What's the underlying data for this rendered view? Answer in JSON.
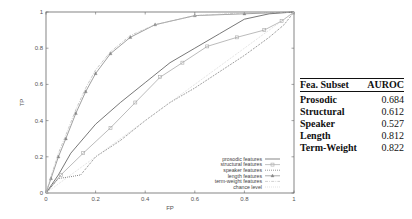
{
  "chart_data": {
    "type": "line",
    "title": "",
    "xlabel": "FP",
    "ylabel": "TP",
    "xlim": [
      0,
      1
    ],
    "ylim": [
      0,
      1
    ],
    "x_ticks": [
      "0",
      "0.2",
      "0.4",
      "0.6",
      "0.8",
      "1"
    ],
    "y_ticks": [
      "0",
      "0.2",
      "0.4",
      "0.6",
      "0.8",
      "1"
    ],
    "grid": false,
    "legend_position": "lower right",
    "series": [
      {
        "name": "prosodic features",
        "marker": "none",
        "style": "solid",
        "color": "#555555",
        "points": [
          [
            0,
            0
          ],
          [
            0.05,
            0.1
          ],
          [
            0.1,
            0.22
          ],
          [
            0.2,
            0.38
          ],
          [
            0.3,
            0.5
          ],
          [
            0.4,
            0.61
          ],
          [
            0.5,
            0.72
          ],
          [
            0.6,
            0.8
          ],
          [
            0.7,
            0.88
          ],
          [
            0.8,
            0.96
          ],
          [
            0.9,
            0.99
          ],
          [
            1,
            1
          ]
        ]
      },
      {
        "name": "structural features",
        "marker": "square",
        "style": "solid",
        "color": "#aaaaaa",
        "points": [
          [
            0,
            0
          ],
          [
            0.06,
            0.1
          ],
          [
            0.15,
            0.22
          ],
          [
            0.26,
            0.36
          ],
          [
            0.36,
            0.5
          ],
          [
            0.46,
            0.64
          ],
          [
            0.55,
            0.72
          ],
          [
            0.65,
            0.81
          ],
          [
            0.77,
            0.86
          ],
          [
            0.88,
            0.9
          ],
          [
            0.95,
            0.95
          ],
          [
            1,
            1
          ]
        ]
      },
      {
        "name": "speaker features",
        "marker": "none",
        "style": "dotted",
        "color": "#444444",
        "points": [
          [
            0,
            0
          ],
          [
            0.05,
            0.08
          ],
          [
            0.1,
            0.09
          ],
          [
            0.14,
            0.1
          ],
          [
            0.2,
            0.2
          ],
          [
            0.3,
            0.29
          ],
          [
            0.4,
            0.4
          ],
          [
            0.5,
            0.5
          ],
          [
            0.6,
            0.58
          ],
          [
            0.7,
            0.67
          ],
          [
            0.8,
            0.76
          ],
          [
            0.9,
            0.86
          ],
          [
            0.96,
            0.93
          ],
          [
            1,
            1
          ]
        ]
      },
      {
        "name": "length features",
        "marker": "triangle",
        "style": "solid",
        "color": "#888888",
        "points": [
          [
            0,
            0
          ],
          [
            0.02,
            0.08
          ],
          [
            0.05,
            0.2
          ],
          [
            0.08,
            0.3
          ],
          [
            0.12,
            0.44
          ],
          [
            0.16,
            0.56
          ],
          [
            0.2,
            0.66
          ],
          [
            0.26,
            0.77
          ],
          [
            0.34,
            0.86
          ],
          [
            0.44,
            0.93
          ],
          [
            0.6,
            0.98
          ],
          [
            0.8,
            0.99
          ],
          [
            1,
            1
          ]
        ]
      },
      {
        "name": "term-weight features",
        "marker": "none",
        "style": "dash-dot",
        "color": "#bbbbbb",
        "points": [
          [
            0,
            0
          ],
          [
            0.02,
            0.09
          ],
          [
            0.05,
            0.22
          ],
          [
            0.08,
            0.32
          ],
          [
            0.12,
            0.46
          ],
          [
            0.16,
            0.58
          ],
          [
            0.2,
            0.68
          ],
          [
            0.26,
            0.78
          ],
          [
            0.34,
            0.87
          ],
          [
            0.44,
            0.93
          ],
          [
            0.6,
            0.98
          ],
          [
            0.8,
            0.995
          ],
          [
            1,
            1
          ]
        ]
      },
      {
        "name": "chance level",
        "marker": "none",
        "style": "dotted",
        "color": "#cccccc",
        "points": [
          [
            0,
            0
          ],
          [
            1,
            1
          ]
        ]
      }
    ]
  },
  "table": {
    "headers": [
      "Fea. Subset",
      "AUROC"
    ],
    "rows": [
      {
        "name": "Prosodic",
        "value": "0.684"
      },
      {
        "name": "Structural",
        "value": "0.612"
      },
      {
        "name": "Speaker",
        "value": "0.527"
      },
      {
        "name": "Length",
        "value": "0.812"
      },
      {
        "name": "Term-Weight",
        "value": "0.822"
      }
    ]
  }
}
